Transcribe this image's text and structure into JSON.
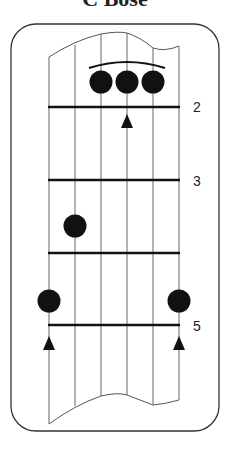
{
  "title": "C Bose",
  "diagram": {
    "type": "guitar-chord-fretboard",
    "strings": 6,
    "fret_labels": [
      {
        "fret": 2,
        "label": "2"
      },
      {
        "fret": 3,
        "label": "3"
      },
      {
        "fret": 5,
        "label": "5"
      }
    ],
    "notes": [
      {
        "string": 4,
        "position": "above fret 2"
      },
      {
        "string": 5,
        "position": "above fret 2"
      },
      {
        "string": 6,
        "position": "above fret 2"
      },
      {
        "string": 2,
        "position": "between 3rd and 4th lines"
      },
      {
        "string": 1,
        "position": "above fret 5"
      },
      {
        "string": 6,
        "position": "above fret 5"
      }
    ],
    "barre": {
      "strings": [
        4,
        6
      ],
      "position": "above fret 2"
    },
    "markers": [
      {
        "type": "triangle",
        "string": 5,
        "fret": 2
      },
      {
        "type": "triangle",
        "string": 1,
        "fret": 5
      },
      {
        "type": "triangle",
        "string": 6,
        "fret": 5
      }
    ],
    "colors": {
      "ink": "#111111",
      "line": "#555555",
      "background": "#ffffff"
    }
  },
  "labels": {
    "fret2": "2",
    "fret3": "3",
    "fret5": "5"
  }
}
